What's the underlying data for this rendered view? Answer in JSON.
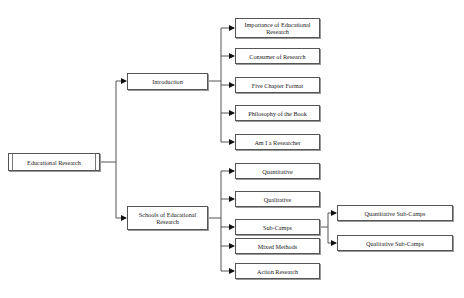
{
  "diagram": {
    "type": "tree",
    "root": {
      "label": "Educational Research"
    },
    "branches": [
      {
        "label": "Introduction",
        "children": [
          {
            "label": "Importance of Educational Research"
          },
          {
            "label": "Consumer of Research"
          },
          {
            "label": "Five Chapter Format"
          },
          {
            "label": "Philosophy of the Book"
          },
          {
            "label": "Am I a Researcher"
          }
        ]
      },
      {
        "label": "Schools of Educational Research",
        "children": [
          {
            "label": "Quantitative"
          },
          {
            "label": "Qualitative"
          },
          {
            "label": "Sub-Camps",
            "children": [
              {
                "label": "Quantitative Sub-Camps"
              },
              {
                "label": "Qualitative Sub-Camps"
              }
            ]
          },
          {
            "label": "Mixed Methods"
          },
          {
            "label": "Action Research"
          }
        ]
      }
    ],
    "colors": {
      "line": "#555555",
      "box_border": "#555555",
      "text": "#222222",
      "background": "#ffffff"
    }
  }
}
